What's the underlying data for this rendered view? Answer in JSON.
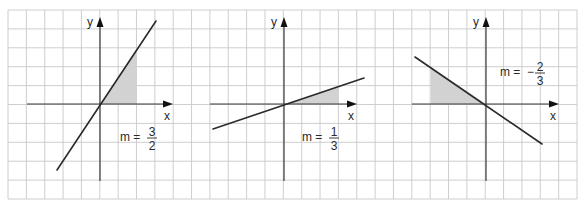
{
  "grid": {
    "x0": 8,
    "y0": 10,
    "x1": 577,
    "y1": 199,
    "cols": 31,
    "rows": 10,
    "line_color": "#c8c8c8",
    "border_color": "#bdbdbd"
  },
  "colors": {
    "axis": "#3a3a3a",
    "line": "#2a2a2a",
    "shade": "#d2d2d2",
    "text": "#2a2a2a"
  },
  "graphs": [
    {
      "name": "graph-positive-steep",
      "origin": [
        100,
        104
      ],
      "x_axis": [
        27,
        173
      ],
      "y_axis": [
        181,
        17
      ],
      "x_label": "x",
      "y_label": "y",
      "line": [
        [
          57,
          170
        ],
        [
          156,
          21
        ]
      ],
      "triangle": [
        [
          100,
          104
        ],
        [
          137,
          104
        ],
        [
          137,
          48
        ]
      ],
      "slope": {
        "prefix": "m =",
        "sign": "",
        "numerator": "3",
        "denominator": "2",
        "pos": [
          120,
          141
        ]
      }
    },
    {
      "name": "graph-positive-shallow",
      "origin": [
        284,
        104
      ],
      "x_axis": [
        210,
        357
      ],
      "y_axis": [
        181,
        17
      ],
      "x_label": "x",
      "y_label": "y",
      "line": [
        [
          213,
          129
        ],
        [
          364,
          78
        ]
      ],
      "triangle": [
        [
          284,
          104
        ],
        [
          339,
          104
        ],
        [
          339,
          86
        ]
      ],
      "slope": {
        "prefix": "m =",
        "sign": "",
        "numerator": "1",
        "denominator": "3",
        "pos": [
          302,
          141
        ]
      }
    },
    {
      "name": "graph-negative",
      "origin": [
        486,
        104
      ],
      "x_axis": [
        412,
        559
      ],
      "y_axis": [
        181,
        17
      ],
      "x_label": "x",
      "y_label": "y",
      "line": [
        [
          415,
          57
        ],
        [
          542,
          144
        ]
      ],
      "triangle": [
        [
          431,
          104
        ],
        [
          486,
          104
        ],
        [
          431,
          67
        ]
      ],
      "slope": {
        "prefix": "m =",
        "sign": "−",
        "numerator": "2",
        "denominator": "3",
        "pos": [
          500,
          76
        ]
      }
    }
  ]
}
